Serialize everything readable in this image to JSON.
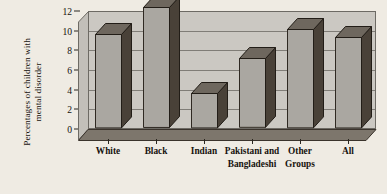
{
  "chart_data": {
    "type": "bar",
    "title": "",
    "subtitle": "",
    "xlabel": "",
    "ylabel": "Percentages of children with mental disorder",
    "ylabel_lines": [
      "Percentages of children with",
      "mental disorder"
    ],
    "categories": [
      "White",
      "Black",
      "Indian",
      "Pakistani and Bangladeshi",
      "Other Groups",
      "All"
    ],
    "category_lines": [
      [
        "White"
      ],
      [
        "Black"
      ],
      [
        "Indian"
      ],
      [
        "Pakistani and",
        "Bangladeshi"
      ],
      [
        "Other",
        "Groups"
      ],
      [
        "All"
      ]
    ],
    "values": [
      9.5,
      12.2,
      3.5,
      7.0,
      10.0,
      9.2
    ],
    "ylim": [
      0,
      12
    ],
    "yticks": [
      0,
      2,
      4,
      6,
      8,
      10,
      12
    ],
    "ytick_labels": [
      "0",
      "2",
      "4",
      "6",
      "8",
      "10",
      "12"
    ],
    "grid": true,
    "legend": false,
    "style_3d": true
  },
  "colors": {
    "page_background": "#efebe3",
    "plot_background": "#cbc8c2",
    "bar_front": "#aaa7a1",
    "bar_side": "#494138",
    "bar_top": "#6e675e",
    "gridline": "#807d77",
    "axis": "#2a2620",
    "text": "#16120e"
  }
}
